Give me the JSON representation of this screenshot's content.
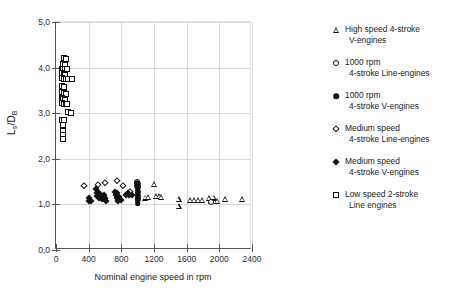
{
  "chart_data": {
    "type": "scatter",
    "title": "",
    "xlabel": "Nominal engine speed in rpm",
    "ylabel": "Ls/DB",
    "ylabel_main": "L",
    "ylabel_sub1": "s",
    "ylabel_mid": "/D",
    "ylabel_sub2": "B",
    "xlim": [
      0,
      2400
    ],
    "ylim": [
      0.0,
      5.0
    ],
    "xticks": [
      0,
      400,
      800,
      1200,
      1600,
      2000,
      2400
    ],
    "xtick_labels": [
      "0",
      "400",
      "800",
      "1200",
      "1600",
      "2000",
      "2400"
    ],
    "yticks": [
      0.0,
      1.0,
      2.0,
      3.0,
      4.0,
      5.0
    ],
    "ytick_labels": [
      "0,0",
      "1,0",
      "2,0",
      "3,0",
      "4,0",
      "5,0"
    ],
    "grid": true,
    "grid_axis": "both",
    "legend_position": "right-outside",
    "series": [
      {
        "name": "High speed 4-stroke V-engines",
        "legend_label_line1": "High speed 4-stroke",
        "legend_label_line2": "V-engines",
        "marker": "triangle-open",
        "marker_icon": "triangle-open-icon",
        "points": [
          [
            1090,
            1.15
          ],
          [
            1130,
            1.16
          ],
          [
            1200,
            1.45
          ],
          [
            1230,
            1.18
          ],
          [
            1260,
            1.18
          ],
          [
            1290,
            1.17
          ],
          [
            1500,
            1.12
          ],
          [
            1500,
            0.97
          ],
          [
            1640,
            1.1
          ],
          [
            1690,
            1.1
          ],
          [
            1740,
            1.09
          ],
          [
            1790,
            1.09
          ],
          [
            1870,
            1.14
          ],
          [
            1900,
            1.08
          ],
          [
            1930,
            1.15
          ],
          [
            1970,
            1.08
          ],
          [
            2070,
            1.12
          ],
          [
            2280,
            1.12
          ]
        ]
      },
      {
        "name": "1000 rpm 4-stroke Line-engines",
        "legend_label_line1": "1000 rpm",
        "legend_label_line2": "4-stroke Line-engines",
        "marker": "circle-open",
        "marker_icon": "circle-open-icon",
        "points": [
          [
            990,
            1.5
          ],
          [
            1000,
            1.44
          ],
          [
            1000,
            1.38
          ],
          [
            1005,
            1.28
          ],
          [
            1000,
            1.19
          ],
          [
            1000,
            1.12
          ],
          [
            1900,
            1.06
          ]
        ]
      },
      {
        "name": "1000 rpm 4-stroke V-engines",
        "legend_label_line1": "1000 rpm",
        "legend_label_line2": "4-stroke V-engines",
        "marker": "circle-fill",
        "marker_icon": "circle-filled-icon",
        "points": [
          [
            995,
            1.46
          ],
          [
            995,
            1.4
          ],
          [
            1000,
            1.33
          ],
          [
            1000,
            1.26
          ],
          [
            1000,
            1.2
          ],
          [
            1000,
            1.14
          ],
          [
            1000,
            1.08
          ],
          [
            1000,
            1.02
          ]
        ]
      },
      {
        "name": "Medium speed 4-stroke Line-engines",
        "legend_label_line1": "Medium speed",
        "legend_label_line2": "4-stroke Line-engines",
        "marker": "diamond-open",
        "marker_icon": "diamond-open-icon",
        "points": [
          [
            340,
            1.4
          ],
          [
            520,
            1.43
          ],
          [
            595,
            1.48
          ],
          [
            750,
            1.52
          ],
          [
            820,
            1.41
          ],
          [
            900,
            1.27
          ]
        ]
      },
      {
        "name": "Medium speed 4-stroke V-engines",
        "legend_label_line1": "Medium speed",
        "legend_label_line2": "4-stroke V-engines",
        "marker": "diamond-fill",
        "marker_icon": "diamond-filled-icon",
        "points": [
          [
            400,
            1.14
          ],
          [
            410,
            1.08
          ],
          [
            430,
            1.08
          ],
          [
            495,
            1.33
          ],
          [
            500,
            1.26
          ],
          [
            505,
            1.19
          ],
          [
            520,
            1.27
          ],
          [
            530,
            1.15
          ],
          [
            545,
            1.2
          ],
          [
            560,
            1.12
          ],
          [
            590,
            1.21
          ],
          [
            600,
            1.14
          ],
          [
            610,
            1.07
          ],
          [
            720,
            1.27
          ],
          [
            730,
            1.2
          ],
          [
            745,
            1.25
          ],
          [
            750,
            1.14
          ],
          [
            760,
            1.08
          ],
          [
            770,
            1.17
          ],
          [
            790,
            1.1
          ],
          [
            860,
            1.21
          ],
          [
            880,
            1.24
          ],
          [
            895,
            1.21
          ],
          [
            935,
            1.2
          ]
        ]
      },
      {
        "name": "Low speed 2-stroke Line engines",
        "legend_label_line1": "Low speed 2-stroke",
        "legend_label_line2": "Line engines",
        "marker": "square-open",
        "marker_icon": "square-open-icon",
        "points": [
          [
            95,
            4.2
          ],
          [
            120,
            4.18
          ],
          [
            80,
            4.08
          ],
          [
            105,
            4.06
          ],
          [
            70,
            3.98
          ],
          [
            90,
            3.98
          ],
          [
            112,
            3.97
          ],
          [
            135,
            3.97
          ],
          [
            70,
            3.88
          ],
          [
            92,
            3.86
          ],
          [
            112,
            3.84
          ],
          [
            75,
            3.78
          ],
          [
            95,
            3.76
          ],
          [
            120,
            3.76
          ],
          [
            150,
            3.76
          ],
          [
            190,
            3.75
          ],
          [
            78,
            3.6
          ],
          [
            100,
            3.58
          ],
          [
            72,
            3.46
          ],
          [
            95,
            3.44
          ],
          [
            118,
            3.43
          ],
          [
            70,
            3.33
          ],
          [
            90,
            3.32
          ],
          [
            112,
            3.3
          ],
          [
            75,
            3.22
          ],
          [
            98,
            3.21
          ],
          [
            120,
            3.21
          ],
          [
            140,
            3.2
          ],
          [
            150,
            3.02
          ],
          [
            178,
            3.01
          ],
          [
            78,
            2.86
          ],
          [
            100,
            2.85
          ],
          [
            82,
            2.74
          ],
          [
            86,
            2.62
          ],
          [
            88,
            2.52
          ],
          [
            90,
            2.44
          ]
        ]
      }
    ]
  }
}
